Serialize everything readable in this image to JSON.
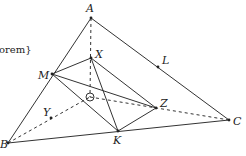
{
  "figure": {
    "caption_fragment": "orem}",
    "points": {
      "A": {
        "label": "A",
        "x": 91,
        "y": 18,
        "lx": 86,
        "ly": 12
      },
      "X": {
        "label": "X",
        "x": 91,
        "y": 58,
        "lx": 95,
        "ly": 58
      },
      "M": {
        "label": "M",
        "x": 52,
        "y": 74,
        "lx": 38,
        "ly": 79
      },
      "O": {
        "label": "O",
        "x": 90,
        "y": 97
      },
      "Z": {
        "label": "Z",
        "x": 156,
        "y": 108,
        "lx": 160,
        "ly": 107
      },
      "K": {
        "label": "K",
        "x": 118,
        "y": 131,
        "lx": 113,
        "ly": 144
      },
      "B": {
        "label": "B",
        "x": 8,
        "y": 143,
        "lx": 0,
        "ly": 148
      },
      "C": {
        "label": "C",
        "x": 229,
        "y": 120,
        "lx": 233,
        "ly": 125
      },
      "L": {
        "label": "L",
        "x": 158,
        "y": 67,
        "lx": 162,
        "ly": 64
      },
      "Y": {
        "label": "Y",
        "x": 51,
        "y": 118,
        "lx": 43,
        "ly": 116
      }
    },
    "solid_segments": [
      [
        "A",
        "B"
      ],
      [
        "A",
        "C"
      ],
      [
        "B",
        "C"
      ],
      [
        "M",
        "X"
      ],
      [
        "X",
        "K"
      ],
      [
        "K",
        "Z"
      ],
      [
        "Z",
        "M"
      ],
      [
        "M",
        "K"
      ],
      [
        "X",
        "Z"
      ]
    ],
    "dashed_segments": [
      [
        "A",
        "O"
      ],
      [
        "B",
        "O"
      ],
      [
        "O",
        "C"
      ]
    ],
    "stroke_color": "#333333"
  }
}
